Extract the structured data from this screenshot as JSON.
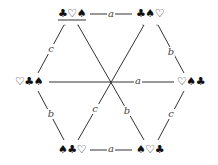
{
  "diagram": {
    "type": "cayley-graph",
    "nodes": [
      {
        "id": "tl",
        "label": "♣♡♠",
        "x": 72,
        "y": 14,
        "underlined": true
      },
      {
        "id": "tr",
        "label": "♣♠♡",
        "x": 150,
        "y": 14,
        "underlined": false
      },
      {
        "id": "ml",
        "label": "♡♣♠",
        "x": 29,
        "y": 82,
        "underlined": false
      },
      {
        "id": "mr",
        "label": "♡♠♣",
        "x": 191,
        "y": 82,
        "underlined": false
      },
      {
        "id": "bl",
        "label": "♠♣♡",
        "x": 72,
        "y": 150,
        "underlined": false
      },
      {
        "id": "br",
        "label": "♠♡♣",
        "x": 150,
        "y": 150,
        "underlined": false
      }
    ],
    "edges": [
      {
        "from": "tl",
        "to": "tr",
        "label": "a",
        "lx": 111,
        "ly": 14
      },
      {
        "from": "tl",
        "to": "ml",
        "label": "c",
        "lx": 51,
        "ly": 49
      },
      {
        "from": "tr",
        "to": "mr",
        "label": "b",
        "lx": 171,
        "ly": 52
      },
      {
        "from": "ml",
        "to": "mr",
        "label": "a",
        "lx": 138,
        "ly": 81
      },
      {
        "from": "ml",
        "to": "bl",
        "label": "b",
        "lx": 51,
        "ly": 114
      },
      {
        "from": "mr",
        "to": "br",
        "label": "c",
        "lx": 171,
        "ly": 114
      },
      {
        "from": "bl",
        "to": "br",
        "label": "a",
        "lx": 111,
        "ly": 149
      },
      {
        "from": "tl",
        "to": "br",
        "label": "b",
        "lx": 127,
        "ly": 111
      },
      {
        "from": "tr",
        "to": "bl",
        "label": "c",
        "lx": 95,
        "ly": 109
      }
    ]
  }
}
